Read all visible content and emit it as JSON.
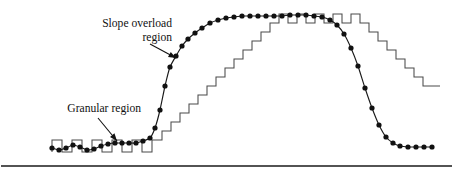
{
  "figure": {
    "background_color": "#ffffff",
    "width": 453,
    "height": 175,
    "annotations": [
      {
        "id": "slope-overload",
        "line1": "Slope overload",
        "line2": "region",
        "text_x": 172,
        "text_y": 27,
        "text_anchor": "end",
        "line_height": 14,
        "leader": {
          "x1": 150,
          "y1": 44,
          "x2": 176,
          "y2": 58
        },
        "arrow_angle_deg": 28
      },
      {
        "id": "granular",
        "line1": "Granular region",
        "line2": "",
        "text_x": 141,
        "text_y": 112,
        "text_anchor": "end",
        "line_height": 14,
        "leader": {
          "x1": 98,
          "y1": 118,
          "x2": 117,
          "y2": 141
        },
        "arrow_angle_deg": 50
      }
    ],
    "bottom_rule": {
      "x1": 1,
      "x2": 452,
      "y": 166,
      "stroke_width": 1.7,
      "color": "#1a1a1a"
    },
    "legend_note": ""
  },
  "chart_data": {
    "type": "line",
    "subtitle": "",
    "xlabel": "",
    "ylabel": "",
    "xlim": [
      0,
      453
    ],
    "ylim": [
      0,
      175
    ],
    "grid": false,
    "legend_position": "none",
    "annotations": [
      "Slope overload region",
      "Granular region"
    ],
    "series": [
      {
        "name": "analog-input-signal",
        "style": "smooth-curve-with-markers",
        "color": "#1a1a1a",
        "marker": "filled-circle",
        "marker_radius": 2.6,
        "points": [
          [
            52,
            148
          ],
          [
            59,
            150
          ],
          [
            66,
            148
          ],
          [
            73,
            145
          ],
          [
            80,
            147
          ],
          [
            87,
            150
          ],
          [
            94,
            149
          ],
          [
            101,
            146
          ],
          [
            108,
            144
          ],
          [
            115,
            143
          ],
          [
            122,
            143
          ],
          [
            129,
            143
          ],
          [
            136,
            143
          ],
          [
            143,
            141
          ],
          [
            150,
            138
          ],
          [
            155,
            128
          ],
          [
            160,
            110
          ],
          [
            165,
            86
          ],
          [
            170,
            67
          ],
          [
            176,
            56
          ],
          [
            182,
            46
          ],
          [
            188,
            39
          ],
          [
            195,
            33
          ],
          [
            202,
            28
          ],
          [
            210,
            23
          ],
          [
            218,
            20
          ],
          [
            226,
            18
          ],
          [
            234,
            17
          ],
          [
            242,
            16
          ],
          [
            250,
            16
          ],
          [
            258,
            16
          ],
          [
            266,
            16
          ],
          [
            274,
            16
          ],
          [
            282,
            16
          ],
          [
            290,
            15
          ],
          [
            298,
            15
          ],
          [
            306,
            15
          ],
          [
            314,
            16
          ],
          [
            322,
            17
          ],
          [
            330,
            20
          ],
          [
            337,
            25
          ],
          [
            344,
            34
          ],
          [
            351,
            48
          ],
          [
            358,
            66
          ],
          [
            365,
            88
          ],
          [
            372,
            108
          ],
          [
            379,
            125
          ],
          [
            386,
            137
          ],
          [
            393,
            143
          ],
          [
            400,
            146
          ],
          [
            408,
            147
          ],
          [
            416,
            147
          ],
          [
            424,
            147
          ],
          [
            432,
            147
          ]
        ]
      },
      {
        "name": "staircase-approximation",
        "style": "step",
        "color": "#4a4a4a",
        "step_width_left": 10,
        "step_width_mid": 9.4,
        "vertices": [
          [
            52,
            152
          ],
          [
            52,
            140
          ],
          [
            62,
            140
          ],
          [
            62,
            152
          ],
          [
            72,
            152
          ],
          [
            72,
            140
          ],
          [
            82,
            140
          ],
          [
            82,
            152
          ],
          [
            92,
            152
          ],
          [
            92,
            140
          ],
          [
            102,
            140
          ],
          [
            102,
            152
          ],
          [
            112,
            152
          ],
          [
            112,
            140
          ],
          [
            122,
            140
          ],
          [
            122,
            152
          ],
          [
            132,
            152
          ],
          [
            132,
            140
          ],
          [
            142,
            140
          ],
          [
            142,
            152
          ],
          [
            152,
            152
          ],
          [
            152,
            140
          ],
          [
            162,
            140
          ],
          [
            162,
            131
          ],
          [
            171,
            131
          ],
          [
            171,
            122
          ],
          [
            180,
            122
          ],
          [
            180,
            113
          ],
          [
            189,
            113
          ],
          [
            189,
            104
          ],
          [
            198,
            104
          ],
          [
            198,
            95
          ],
          [
            207,
            95
          ],
          [
            207,
            86
          ],
          [
            216,
            86
          ],
          [
            216,
            77
          ],
          [
            225,
            77
          ],
          [
            225,
            68
          ],
          [
            234,
            68
          ],
          [
            234,
            59
          ],
          [
            243,
            59
          ],
          [
            243,
            50
          ],
          [
            252,
            50
          ],
          [
            252,
            41
          ],
          [
            261,
            41
          ],
          [
            261,
            32
          ],
          [
            270,
            32
          ],
          [
            270,
            23
          ],
          [
            279,
            23
          ],
          [
            279,
            14
          ],
          [
            288,
            14
          ],
          [
            288,
            23
          ],
          [
            297,
            23
          ],
          [
            297,
            14
          ],
          [
            306,
            14
          ],
          [
            306,
            23
          ],
          [
            315,
            23
          ],
          [
            315,
            14
          ],
          [
            324,
            14
          ],
          [
            324,
            23
          ],
          [
            333,
            23
          ],
          [
            333,
            14
          ],
          [
            342,
            14
          ],
          [
            342,
            23
          ],
          [
            351,
            23
          ],
          [
            351,
            14
          ],
          [
            360,
            14
          ],
          [
            360,
            23
          ],
          [
            369,
            23
          ],
          [
            369,
            32
          ],
          [
            378,
            32
          ],
          [
            378,
            41
          ],
          [
            387,
            41
          ],
          [
            387,
            50
          ],
          [
            396,
            50
          ],
          [
            396,
            59
          ],
          [
            405,
            59
          ],
          [
            405,
            68
          ],
          [
            414,
            68
          ],
          [
            414,
            77
          ],
          [
            423,
            77
          ],
          [
            423,
            86
          ],
          [
            440,
            86
          ]
        ]
      }
    ]
  }
}
